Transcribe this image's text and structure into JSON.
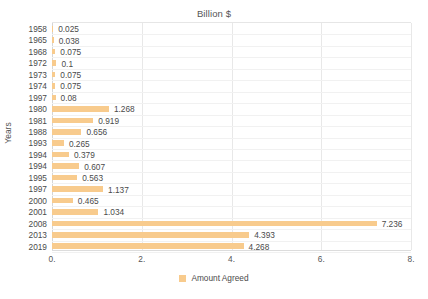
{
  "chart_data": {
    "type": "bar",
    "orientation": "horizontal",
    "title": "Billion $",
    "xlabel": "",
    "ylabel": "Years",
    "xlim": [
      0,
      8
    ],
    "xticks": [
      "0.",
      "2.",
      "4.",
      "6.",
      "8."
    ],
    "xtick_values": [
      0,
      2,
      4,
      6,
      8
    ],
    "grid": true,
    "legend": {
      "position": "bottom",
      "entries": [
        {
          "name": "Amount Agreed",
          "color": "#f8cb8d"
        }
      ]
    },
    "series_name": "Amount Agreed",
    "bar_color": "#f8cb8d",
    "categories": [
      "1958",
      "1965",
      "1968",
      "1972",
      "1973",
      "1974",
      "1997",
      "1980",
      "1981",
      "1988",
      "1993",
      "1994",
      "1994",
      "1995",
      "1997",
      "2000",
      "2001",
      "2008",
      "2013",
      "2019"
    ],
    "values": [
      0.025,
      0.038,
      0.075,
      0.1,
      0.075,
      0.075,
      0.08,
      1.268,
      0.919,
      0.656,
      0.265,
      0.379,
      0.607,
      0.563,
      1.137,
      0.465,
      1.034,
      7.236,
      4.393,
      4.268
    ],
    "value_labels": [
      "0.025",
      "0.038",
      "0.075",
      "0.1",
      "0.075",
      "0.075",
      "0.08",
      "1.268",
      "0.919",
      "0.656",
      "0.265",
      "0.379",
      "0.607",
      "0.563",
      "1.137",
      "0.465",
      "1.034",
      "7.236",
      "4.393",
      "4.268"
    ]
  }
}
